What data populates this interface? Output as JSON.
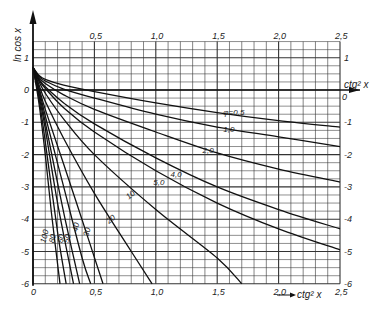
{
  "chart_data": {
    "type": "line",
    "title": "",
    "xlabel": "ctg² x",
    "ylabel": "ln cos x",
    "xlim": [
      0,
      2.5
    ],
    "ylim": [
      -6,
      1.5
    ],
    "grid": true,
    "x_ticks": [
      "0",
      "0,5",
      "1,0",
      "1,5",
      "2,0",
      "2,5"
    ],
    "x_tick_values": [
      0,
      0.5,
      1.0,
      1.5,
      2.0,
      2.5
    ],
    "y_ticks_left": [
      "1",
      "0",
      "-1",
      "-2",
      "-3",
      "-4",
      "-5",
      "-6"
    ],
    "y_ticks_right": [
      "1",
      "0",
      "-1",
      "-2",
      "-3",
      "-4",
      "-5",
      "-6"
    ],
    "y_tick_values": [
      1,
      0,
      -1,
      -2,
      -3,
      -4,
      -5,
      -6
    ],
    "right_axis_label": "ctg² x",
    "parameter_name": "φ",
    "series": [
      {
        "name": "φ=0,5",
        "label": "φ=0,5",
        "label_pos": [
          1.55,
          -0.78
        ],
        "x": [
          0,
          0.05,
          0.1,
          0.25,
          0.5,
          1.0,
          1.5,
          2.0,
          2.5
        ],
        "y": [
          0.7,
          0.45,
          0.33,
          0.15,
          -0.05,
          -0.4,
          -0.7,
          -0.95,
          -1.15
        ]
      },
      {
        "name": "φ=1,0",
        "label": "1,0",
        "label_pos": [
          1.55,
          -1.3
        ],
        "x": [
          0,
          0.05,
          0.1,
          0.25,
          0.5,
          1.0,
          1.5,
          2.0,
          2.5
        ],
        "y": [
          0.7,
          0.42,
          0.28,
          0.03,
          -0.25,
          -0.75,
          -1.15,
          -1.45,
          -1.75
        ]
      },
      {
        "name": "φ=2,0",
        "label": "2,0",
        "label_pos": [
          1.38,
          -1.95
        ],
        "x": [
          0,
          0.05,
          0.1,
          0.25,
          0.5,
          1.0,
          1.5,
          2.0,
          2.5
        ],
        "y": [
          0.7,
          0.38,
          0.2,
          -0.15,
          -0.6,
          -1.3,
          -1.95,
          -2.45,
          -2.85
        ]
      },
      {
        "name": "φ=4,0",
        "label": "4,0",
        "label_pos": [
          1.12,
          -2.7
        ],
        "x": [
          0,
          0.05,
          0.1,
          0.25,
          0.5,
          1.0,
          1.5,
          2.0,
          2.5
        ],
        "y": [
          0.7,
          0.33,
          0.1,
          -0.4,
          -1.05,
          -2.1,
          -3.0,
          -3.7,
          -4.3
        ]
      },
      {
        "name": "φ=5,0",
        "label": "5,0",
        "label_pos": [
          0.98,
          -2.95
        ],
        "x": [
          0,
          0.05,
          0.1,
          0.25,
          0.5,
          1.0,
          1.5,
          2.0,
          2.5
        ],
        "y": [
          0.7,
          0.3,
          0.05,
          -0.55,
          -1.3,
          -2.5,
          -3.5,
          -4.3,
          -4.95
        ]
      },
      {
        "name": "φ=10",
        "label": "10",
        "label_pos": [
          0.78,
          -3.4
        ],
        "x": [
          0,
          0.05,
          0.1,
          0.25,
          0.5,
          1.0,
          1.5,
          1.7
        ],
        "y": [
          0.7,
          0.25,
          -0.1,
          -0.9,
          -2.0,
          -3.7,
          -5.2,
          -6.0
        ]
      },
      {
        "name": "φ=20",
        "label": "20",
        "label_pos": [
          0.62,
          -4.15
        ],
        "x": [
          0,
          0.05,
          0.1,
          0.25,
          0.5,
          0.75,
          0.97
        ],
        "y": [
          0.7,
          0.15,
          -0.35,
          -1.5,
          -3.2,
          -4.7,
          -6.0
        ]
      },
      {
        "name": "φ=30",
        "label": "30",
        "label_pos": [
          0.45,
          -4.55
        ],
        "x": [
          0,
          0.05,
          0.1,
          0.25,
          0.45,
          0.57
        ],
        "y": [
          0.7,
          0.05,
          -0.6,
          -2.3,
          -4.6,
          -6.0
        ]
      },
      {
        "name": "φ=40",
        "label": "40",
        "label_pos": [
          0.36,
          -4.4
        ],
        "x": [
          0,
          0.05,
          0.1,
          0.25,
          0.4,
          0.47
        ],
        "y": [
          0.7,
          0.0,
          -0.8,
          -3.0,
          -5.2,
          -6.0
        ]
      },
      {
        "name": "φ=50",
        "label": "50",
        "label_pos": [
          0.29,
          -4.75
        ],
        "x": [
          0,
          0.05,
          0.1,
          0.25,
          0.38
        ],
        "y": [
          0.7,
          -0.1,
          -1.0,
          -3.8,
          -6.0
        ]
      },
      {
        "name": "φ=60",
        "label": "60",
        "label_pos": [
          0.24,
          -4.75
        ],
        "x": [
          0,
          0.05,
          0.1,
          0.2,
          0.33
        ],
        "y": [
          0.7,
          -0.2,
          -1.2,
          -3.5,
          -6.0
        ]
      },
      {
        "name": "φ=80",
        "label": "80",
        "label_pos": [
          0.17,
          -4.75
        ],
        "x": [
          0,
          0.05,
          0.1,
          0.2,
          0.27
        ],
        "y": [
          0.7,
          -0.3,
          -1.6,
          -4.4,
          -6.0
        ]
      },
      {
        "name": "φ=100",
        "label": "100",
        "label_pos": [
          0.1,
          -4.75
        ],
        "x": [
          0,
          0.05,
          0.1,
          0.15,
          0.22
        ],
        "y": [
          0.7,
          -0.45,
          -2.0,
          -3.8,
          -6.0
        ]
      }
    ]
  }
}
